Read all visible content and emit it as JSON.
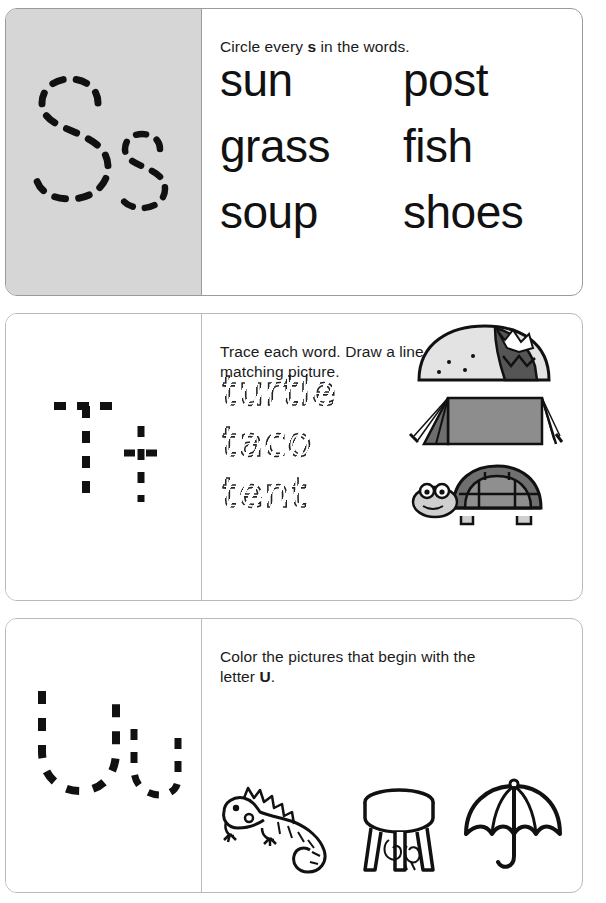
{
  "worksheet": {
    "copyright": "© Rockridge Press"
  },
  "panels": [
    {
      "id": "panel-s",
      "letter_pair": "Ss",
      "letter_upper": "S",
      "letter_lower": "s",
      "shaded": true,
      "background_color": "#d6d6d6",
      "instruction_prefix": "Circle every ",
      "instruction_bold": "s",
      "instruction_suffix": " in the words.",
      "instruction_full": "Circle every s in the words.",
      "words": [
        {
          "left": "sun",
          "right": "post"
        },
        {
          "left": "grass",
          "right": "fish"
        },
        {
          "left": "soup",
          "right": "shoes"
        }
      ]
    },
    {
      "id": "panel-t",
      "letter_pair": "Tt",
      "letter_upper": "T",
      "letter_lower": "t",
      "shaded": false,
      "background_color": "#ffffff",
      "instruction_line1": "Trace each word. Draw a line to the",
      "instruction_line2": "matching picture.",
      "instruction_full": "Trace each word. Draw a line to the matching picture.",
      "trace_words": [
        "turtle",
        "taco",
        "tent"
      ],
      "pictures": [
        {
          "name": "taco-illustration",
          "label": "taco"
        },
        {
          "name": "tent-illustration",
          "label": "tent"
        },
        {
          "name": "turtle-illustration",
          "label": "turtle"
        }
      ]
    },
    {
      "id": "panel-u",
      "letter_pair": "Uu",
      "letter_upper": "U",
      "letter_lower": "u",
      "shaded": false,
      "background_color": "#ffffff",
      "instruction_prefix": "Color the pictures that begin with the letter ",
      "instruction_bold": "U",
      "instruction_suffix": ".",
      "instruction_line1": "Color the pictures that begin with the",
      "instruction_line2_prefix": "letter ",
      "instruction_line2_bold": "U",
      "instruction_line2_suffix": ".",
      "instruction_full": "Color the pictures that begin with the letter U.",
      "pictures": [
        {
          "name": "iguana-illustration",
          "label": "iguana"
        },
        {
          "name": "stool-illustration",
          "label": "stool"
        },
        {
          "name": "umbrella-illustration",
          "label": "umbrella"
        }
      ]
    }
  ]
}
